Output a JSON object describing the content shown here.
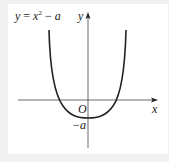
{
  "diagram": {
    "formula": {
      "lhs": "y",
      "eq": " = ",
      "base": "x",
      "exponent": "2",
      "minus": " − ",
      "param": "a"
    },
    "axes": {
      "x_label": "x",
      "y_label": "y",
      "origin_label": "O"
    },
    "annotations": {
      "y_intercept_label": "−a"
    },
    "colors": {
      "background": "#f1f1f1",
      "panel": "#ffffff",
      "stroke": "#222222"
    }
  }
}
